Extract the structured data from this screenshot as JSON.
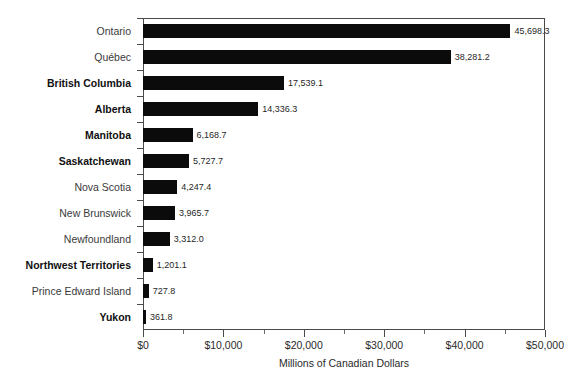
{
  "chart_data": {
    "type": "bar",
    "orientation": "horizontal",
    "title": "",
    "subtitle": "",
    "xlabel": "Millions of Canadian Dollars",
    "ylabel": "",
    "xlim": [
      0,
      50000
    ],
    "x_major_ticks": [
      0,
      10000,
      20000,
      30000,
      40000,
      50000
    ],
    "x_tick_labels": [
      "$0",
      "$10,000",
      "$20,000",
      "$30,000",
      "$40,000",
      "$50,000"
    ],
    "x_minor_ticks": [
      5000,
      15000,
      25000,
      35000,
      45000
    ],
    "grid": false,
    "legend": false,
    "bar_color": "#0b0b0b",
    "categories": [
      "Ontario",
      "Québec",
      "British Columbia",
      "Alberta",
      "Manitoba",
      "Saskatchewan",
      "Nova Scotia",
      "New Brunswick",
      "Newfoundland",
      "Northwest Territories",
      "Prince Edward Island",
      "Yukon"
    ],
    "values": [
      45698.3,
      38281.2,
      17539.1,
      14336.3,
      6168.7,
      5727.7,
      4247.4,
      3965.7,
      3312.0,
      1201.1,
      727.8,
      361.8
    ],
    "value_labels": [
      "45,698.3",
      "38,281.2",
      "17,539.1",
      "14,336.3",
      "6,168.7",
      "5,727.7",
      "4,247.4",
      "3,965.7",
      "3,312.0",
      "1,201.1",
      "727.8",
      "361.8"
    ],
    "label_emphasis": [
      false,
      false,
      true,
      true,
      true,
      true,
      false,
      false,
      false,
      true,
      false,
      true
    ]
  }
}
